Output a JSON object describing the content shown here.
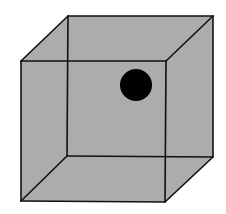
{
  "figure": {
    "type": "necker-cube",
    "canvas": {
      "width": 226,
      "height": 214
    },
    "colors": {
      "background": "#ffffff",
      "face_fill": "#acacac",
      "edge": "#111111",
      "dot": "#000000"
    },
    "vertices": {
      "front_top_left": [
        21,
        61
      ],
      "front_top_right": [
        166,
        61
      ],
      "front_bottom_left": [
        21,
        201
      ],
      "front_bottom_right": [
        165,
        202
      ],
      "back_top_left": [
        68,
        16
      ],
      "back_top_right": [
        213,
        16
      ],
      "back_bottom_left": [
        67,
        156
      ],
      "back_bottom_right": [
        213,
        157
      ]
    },
    "dot": {
      "cx": 136,
      "cy": 85,
      "r": 16
    }
  }
}
